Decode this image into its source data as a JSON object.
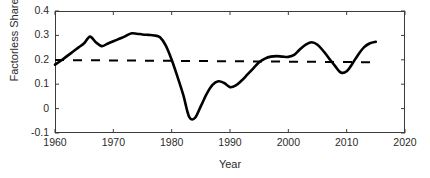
{
  "chart_data": {
    "type": "line",
    "title": "",
    "xlabel": "Year",
    "ylabel": "Factorless Share",
    "xlim": [
      1960,
      2020
    ],
    "ylim": [
      -0.1,
      0.4
    ],
    "xticks": [
      1960,
      1970,
      1980,
      1990,
      2000,
      2010,
      2020
    ],
    "xtick_labels": [
      "1960",
      "1970",
      "1980",
      "1990",
      "2000",
      "2010",
      "2020"
    ],
    "yticks": [
      -0.1,
      0,
      0.1,
      0.2,
      0.3,
      0.4
    ],
    "ytick_labels": [
      "-0.1",
      "0",
      "0.1",
      "0.2",
      "0.3",
      "0.4"
    ],
    "grid": false,
    "legend": "none",
    "series": [
      {
        "name": "Factorless Share",
        "style": "solid",
        "color": "#000000",
        "linewidth": 2.6,
        "x": [
          1960,
          1961,
          1962,
          1963,
          1964,
          1965,
          1966,
          1967,
          1968,
          1969,
          1970,
          1971,
          1972,
          1973,
          1974,
          1975,
          1976,
          1977,
          1978,
          1979,
          1980,
          1981,
          1982,
          1983,
          1984,
          1985,
          1986,
          1987,
          1988,
          1989,
          1990,
          1991,
          1992,
          1993,
          1994,
          1995,
          1996,
          1997,
          1998,
          1999,
          2000,
          2001,
          2002,
          2003,
          2004,
          2005,
          2006,
          2007,
          2008,
          2009,
          2010,
          2011,
          2012,
          2013,
          2014,
          2015
        ],
        "y": [
          0.18,
          0.196,
          0.214,
          0.232,
          0.25,
          0.268,
          0.295,
          0.272,
          0.256,
          0.266,
          0.276,
          0.286,
          0.296,
          0.308,
          0.307,
          0.304,
          0.302,
          0.3,
          0.292,
          0.258,
          0.2,
          0.13,
          0.055,
          -0.034,
          -0.038,
          0.01,
          0.06,
          0.097,
          0.112,
          0.105,
          0.088,
          0.095,
          0.115,
          0.14,
          0.165,
          0.19,
          0.205,
          0.213,
          0.215,
          0.213,
          0.212,
          0.22,
          0.243,
          0.262,
          0.272,
          0.262,
          0.236,
          0.205,
          0.175,
          0.148,
          0.153,
          0.185,
          0.222,
          0.252,
          0.268,
          0.274
        ]
      },
      {
        "name": "Average",
        "style": "dashed",
        "color": "#000000",
        "linewidth": 2.0,
        "x": [
          1960,
          2015
        ],
        "y": [
          0.199,
          0.19
        ]
      }
    ],
    "annotations": []
  },
  "axes": {
    "frame_color": "#3c3c3c",
    "text_color": "#2b2b2b",
    "background": "#ffffff"
  }
}
